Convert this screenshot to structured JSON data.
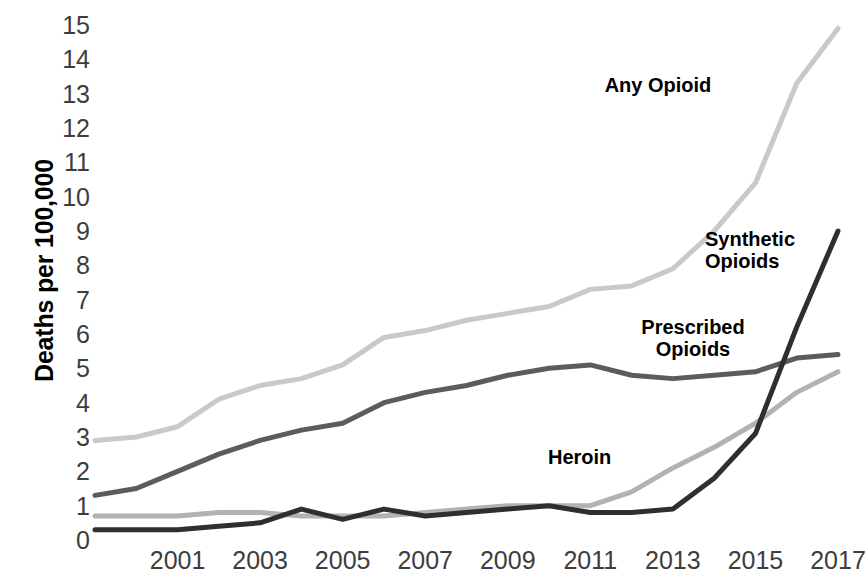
{
  "axes": {
    "y_title": "Deaths per 100,000",
    "y_ticks": [
      "15",
      "14",
      "13",
      "12",
      "11",
      "10",
      "9",
      "8",
      "7",
      "6",
      "5",
      "4",
      "3",
      "2",
      "1",
      "0"
    ],
    "x_ticks": [
      "2001",
      "2003",
      "2005",
      "2007",
      "2009",
      "2011",
      "2013",
      "2015",
      "2017"
    ]
  },
  "labels": {
    "any_opioid": "Any Opioid",
    "synthetic_opioids": "Synthetic\nOpioids",
    "prescribed_opioids": "Prescribed\nOpioids",
    "heroin": "Heroin"
  },
  "colors": {
    "any_opioid": "#c9c9c9",
    "heroin": "#b2b2b2",
    "prescribed_opioids": "#5c5c5c",
    "synthetic_opioids": "#2f2f2f",
    "tick_text": "#3d3d3d",
    "label_text": "#000000",
    "background": "#ffffff"
  },
  "chart_data": {
    "type": "line",
    "title": "",
    "xlabel": "",
    "ylabel": "Deaths per 100,000",
    "xlim": [
      1999,
      2017
    ],
    "ylim": [
      0,
      15
    ],
    "grid": false,
    "legend": "inline-labels",
    "x": [
      1999,
      2000,
      2001,
      2002,
      2003,
      2004,
      2005,
      2006,
      2007,
      2008,
      2009,
      2010,
      2011,
      2012,
      2013,
      2014,
      2015,
      2016,
      2017
    ],
    "series": [
      {
        "name": "Any Opioid",
        "color": "#c9c9c9",
        "values": [
          2.9,
          3.0,
          3.3,
          4.1,
          4.5,
          4.7,
          5.1,
          5.9,
          6.1,
          6.4,
          6.6,
          6.8,
          7.3,
          7.4,
          7.9,
          9.0,
          10.4,
          13.3,
          14.9
        ]
      },
      {
        "name": "Prescribed Opioids",
        "color": "#5c5c5c",
        "values": [
          1.3,
          1.5,
          2.0,
          2.5,
          2.9,
          3.2,
          3.4,
          4.0,
          4.3,
          4.5,
          4.8,
          5.0,
          5.1,
          4.8,
          4.7,
          4.8,
          4.9,
          5.3,
          5.4
        ]
      },
      {
        "name": "Heroin",
        "color": "#b2b2b2",
        "values": [
          0.7,
          0.7,
          0.7,
          0.8,
          0.8,
          0.7,
          0.7,
          0.7,
          0.8,
          0.9,
          1.0,
          1.0,
          1.0,
          1.4,
          2.1,
          2.7,
          3.4,
          4.3,
          4.9
        ]
      },
      {
        "name": "Synthetic Opioids",
        "color": "#2f2f2f",
        "values": [
          0.3,
          0.3,
          0.3,
          0.4,
          0.5,
          0.9,
          0.6,
          0.9,
          0.7,
          0.8,
          0.9,
          1.0,
          0.8,
          0.8,
          0.9,
          1.8,
          3.1,
          6.2,
          9.0
        ]
      }
    ]
  }
}
